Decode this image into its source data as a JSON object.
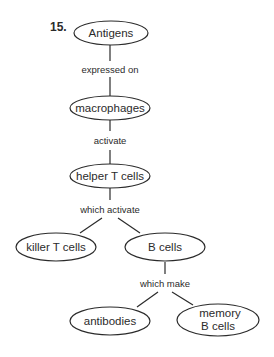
{
  "question_number": "15.",
  "nodes": {
    "antigens": "Antigens",
    "macrophages": "macrophages",
    "helper_t_cells": "helper T cells",
    "killer_t_cells": "killer T cells",
    "b_cells": "B cells",
    "antibodies": "antibodies",
    "memory_b_cells_line1": "memory",
    "memory_b_cells_line2": "B cells"
  },
  "links": {
    "expressed_on": "expressed on",
    "activate": "activate",
    "which_activate": "which activate",
    "which_make": "which make"
  },
  "colors": {
    "stroke": "#2b2b2b",
    "background": "#ffffff"
  }
}
